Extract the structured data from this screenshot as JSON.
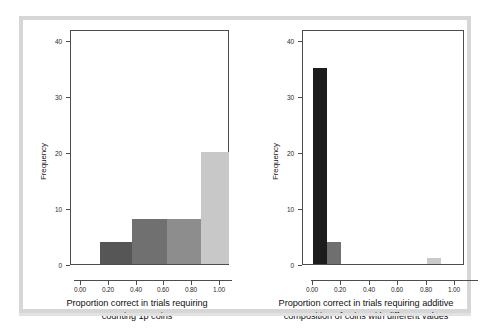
{
  "figure": {
    "background_color": "#ffffff",
    "frame_color": "#d6d6d6",
    "axis_color": "#4d4d4d"
  },
  "chart_data": [
    {
      "type": "bar",
      "panel": "left",
      "title": "",
      "xlabel_line1": "Proportion correct in trials requiring",
      "xlabel_line2": "counting 1p coins",
      "ylabel": "Frequency",
      "xlim": [
        -0.07,
        1.07
      ],
      "ylim": [
        0,
        42
      ],
      "xticks": [
        0.0,
        0.2,
        0.4,
        0.6,
        0.8,
        1.0
      ],
      "xtick_labels": [
        "0.00",
        "0.20",
        "0.40",
        "0.60",
        "0.80",
        "1.00"
      ],
      "yticks": [
        0,
        10,
        20,
        30,
        40
      ],
      "ytick_labels": [
        "0",
        "10",
        "20",
        "30",
        "40"
      ],
      "grid": false,
      "legend": "none",
      "bins": [
        {
          "x0": 0.14,
          "x1": 0.37,
          "value": 4,
          "color": "#565656"
        },
        {
          "x0": 0.37,
          "x1": 0.62,
          "value": 8,
          "color": "#707070"
        },
        {
          "x0": 0.62,
          "x1": 0.86,
          "value": 8,
          "color": "#8d8d8d"
        },
        {
          "x0": 0.86,
          "x1": 1.06,
          "value": 20,
          "color": "#c8c8c8"
        }
      ]
    },
    {
      "type": "bar",
      "panel": "right",
      "title": "",
      "xlabel_line1": "Proportion correct in trials requiring additive",
      "xlabel_line2": "composition of coins with different values",
      "ylabel": "Frequency",
      "xlim": [
        -0.07,
        1.07
      ],
      "ylim": [
        0,
        42
      ],
      "xticks": [
        0.0,
        0.2,
        0.4,
        0.6,
        0.8,
        1.0
      ],
      "xtick_labels": [
        "0.00",
        "0.20",
        "0.40",
        "0.60",
        "0.80",
        "1.00"
      ],
      "yticks": [
        0,
        10,
        20,
        30,
        40
      ],
      "ytick_labels": [
        "0",
        "10",
        "20",
        "30",
        "40"
      ],
      "grid": false,
      "legend": "none",
      "bins": [
        {
          "x0": 0.0,
          "x1": 0.1,
          "value": 35,
          "color": "#1c1c1c"
        },
        {
          "x0": 0.1,
          "x1": 0.2,
          "value": 4,
          "color": "#6f6f6f"
        },
        {
          "x0": 0.8,
          "x1": 0.9,
          "value": 1,
          "color": "#c9c9c9"
        }
      ]
    }
  ]
}
